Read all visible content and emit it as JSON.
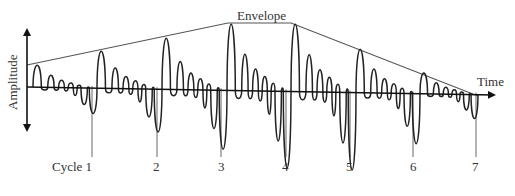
{
  "labels": {
    "envelope": "Envelope",
    "amplitude": "Amplitude",
    "time": "Time"
  },
  "cycles": [
    {
      "label": "Cycle 1",
      "line_x": 92,
      "start_x": 33,
      "peak_y": 65,
      "label_x": 52
    },
    {
      "label": "2",
      "line_x": 157,
      "start_x": 97,
      "peak_y": 51,
      "label_x": 153
    },
    {
      "label": "3",
      "line_x": 221,
      "start_x": 162,
      "peak_y": 38,
      "label_x": 218
    },
    {
      "label": "4",
      "line_x": 286,
      "start_x": 227,
      "peak_y": 24,
      "label_x": 282
    },
    {
      "label": "5",
      "line_x": 350,
      "start_x": 291,
      "peak_y": 24,
      "label_x": 346
    },
    {
      "label": "6",
      "line_x": 413,
      "start_x": 356,
      "peak_y": 49,
      "label_x": 410
    },
    {
      "label": "7",
      "line_x": 476,
      "start_x": 420,
      "peak_y": 73,
      "label_x": 472
    }
  ],
  "envelope_points": [
    [
      27,
      65
    ],
    [
      228,
      23
    ],
    [
      291,
      23
    ],
    [
      478,
      96
    ]
  ],
  "time_axis": {
    "x1": 27,
    "y1": 87,
    "x2": 494,
    "y2": 95
  },
  "amplitude_axis": {
    "x": 27,
    "y1": 30,
    "y2": 130
  },
  "colors": {
    "stroke": "#222222",
    "envelope": "#555555",
    "cycle_line": "#666666"
  }
}
